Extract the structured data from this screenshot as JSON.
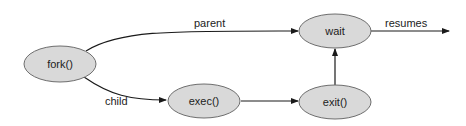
{
  "nodes": {
    "fork": "fork()",
    "wait": "wait",
    "exec": "exec()",
    "exit": "exit()"
  },
  "edges": {
    "parent": "parent",
    "child": "child",
    "resumes": "resumes"
  },
  "colors": {
    "node_fill": "#d9d9d9",
    "node_stroke": "#6e6e6e",
    "edge": "#1a1a1a"
  }
}
